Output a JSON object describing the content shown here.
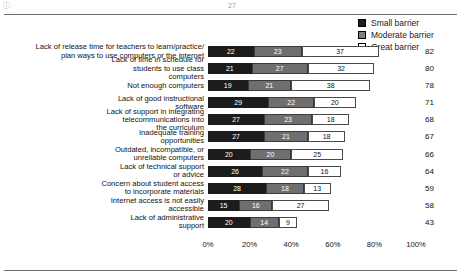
{
  "page": {
    "corner_mark": "ⓘ",
    "page_number": "27"
  },
  "legend": {
    "position": "top-right",
    "items": [
      {
        "label": "Small barrier",
        "color": "#1c1c1c",
        "key": "small"
      },
      {
        "label": "Moderate barrier",
        "color": "#6f6f6f",
        "key": "moderate"
      },
      {
        "label": "Great barrier",
        "color": "#ffffff",
        "key": "great"
      }
    ]
  },
  "chart_data": {
    "type": "bar",
    "orientation": "horizontal",
    "stacked": true,
    "title": "",
    "xlabel": "",
    "ylabel": "",
    "xlim": [
      0,
      100
    ],
    "grid": false,
    "xticks": [
      "0%",
      "20%",
      "40%",
      "60%",
      "80%",
      "100%"
    ],
    "xtick_values": [
      0,
      20,
      40,
      60,
      80,
      100
    ],
    "legend_position": "top-right",
    "categories": [
      "Lack of release time for teachers to learn/practice/\nplan ways to use computers or the internet",
      "Lack of time in schedule for\nstudents to use class\ncomputers",
      "Not enough computers",
      "Lack of good instructional\nsoftware",
      "Lack of support in integrating\ntelecommunications into\nthe curriculum",
      "Inadequate training\nopportunities",
      "Outdated, incompatible, or\nunreliable computers",
      "Lack of technical support\nor advice",
      "Concern about student access\nto incorporate materials",
      "Internet access is not easily\naccessible",
      "Lack of administrative\nsupport"
    ],
    "series": [
      {
        "name": "Small barrier",
        "color": "#1c1c1c",
        "values": [
          22,
          21,
          19,
          29,
          27,
          27,
          20,
          26,
          28,
          15,
          20
        ]
      },
      {
        "name": "Moderate barrier",
        "color": "#6f6f6f",
        "values": [
          23,
          27,
          21,
          22,
          23,
          21,
          20,
          22,
          18,
          16,
          14
        ]
      },
      {
        "name": "Great barrier",
        "color": "#ffffff",
        "values": [
          37,
          32,
          38,
          20,
          18,
          18,
          25,
          16,
          13,
          27,
          9
        ]
      }
    ],
    "totals": [
      82,
      80,
      78,
      71,
      68,
      67,
      66,
      64,
      59,
      58,
      43
    ],
    "rows": [
      {
        "category": "Lack of release time for teachers to learn/practice/\nplan ways to use computers or the internet",
        "small": 22,
        "moderate": 23,
        "great": 37,
        "total": 82
      },
      {
        "category": "Lack of time in schedule for\nstudents to use class\ncomputers",
        "small": 21,
        "moderate": 27,
        "great": 32,
        "total": 80
      },
      {
        "category": "Not enough computers",
        "small": 19,
        "moderate": 21,
        "great": 38,
        "total": 78
      },
      {
        "category": "Lack of good instructional\nsoftware",
        "small": 29,
        "moderate": 22,
        "great": 20,
        "total": 71
      },
      {
        "category": "Lack of support in integrating\ntelecommunications into\nthe curriculum",
        "small": 27,
        "moderate": 23,
        "great": 18,
        "total": 68
      },
      {
        "category": "Inadequate training\nopportunities",
        "small": 27,
        "moderate": 21,
        "great": 18,
        "total": 67
      },
      {
        "category": "Outdated, incompatible, or\nunreliable computers",
        "small": 20,
        "moderate": 20,
        "great": 25,
        "total": 66
      },
      {
        "category": "Lack of technical support\nor advice",
        "small": 26,
        "moderate": 22,
        "great": 16,
        "total": 64
      },
      {
        "category": "Concern about student access\nto incorporate materials",
        "small": 28,
        "moderate": 18,
        "great": 13,
        "total": 59
      },
      {
        "category": "Internet access is not easily\naccessible",
        "small": 15,
        "moderate": 16,
        "great": 27,
        "total": 58
      },
      {
        "category": "Lack of administrative\nsupport",
        "small": 20,
        "moderate": 14,
        "great": 9,
        "total": 43
      }
    ]
  }
}
